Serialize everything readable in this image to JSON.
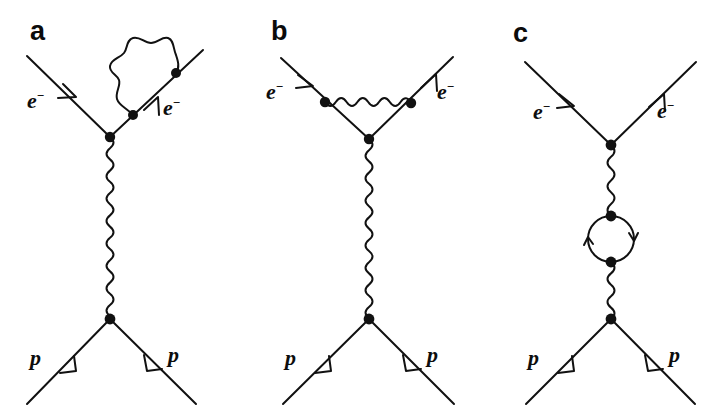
{
  "figure": {
    "type": "feynman-diagrams",
    "background_color": "#ffffff",
    "line_color": "#111111",
    "panel_count": 3
  },
  "panels": [
    {
      "id": "a",
      "label": "a",
      "description": "Electron-proton scattering with electron self-energy correction on the outgoing electron line",
      "labels": {
        "incoming_electron": "e",
        "incoming_electron_charge": "−",
        "outgoing_electron": "e",
        "outgoing_electron_charge": "−",
        "incoming_proton": "p",
        "outgoing_proton": "p"
      },
      "vertices": 4,
      "photon_lines": 2,
      "loop_type": "self-energy"
    },
    {
      "id": "b",
      "label": "b",
      "description": "Electron-proton scattering with vertex correction photon connecting the two electron legs",
      "labels": {
        "incoming_electron": "e",
        "incoming_electron_charge": "−",
        "outgoing_electron": "e",
        "outgoing_electron_charge": "−",
        "incoming_proton": "p",
        "outgoing_proton": "p"
      },
      "vertices": 4,
      "photon_lines": 2,
      "loop_type": "vertex-correction"
    },
    {
      "id": "c",
      "label": "c",
      "description": "Electron-proton scattering with vacuum polarization fermion loop in the exchanged photon",
      "labels": {
        "incoming_electron": "e",
        "incoming_electron_charge": "−",
        "outgoing_electron": "e",
        "outgoing_electron_charge": "−",
        "incoming_proton": "p",
        "outgoing_proton": "p"
      },
      "vertices": 4,
      "photon_lines": 2,
      "loop_type": "vacuum-polarization"
    }
  ]
}
